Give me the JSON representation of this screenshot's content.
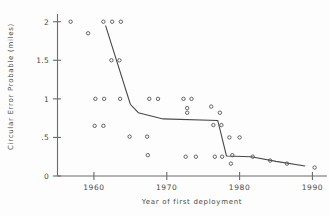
{
  "chart_data": {
    "type": "scatter",
    "title": "",
    "xlabel": "Year of first deployment",
    "ylabel": "Circular Error Probable (miles)",
    "xlim": [
      1955,
      1992
    ],
    "ylim": [
      0,
      2.1
    ],
    "xticks": [
      1960,
      1970,
      1980,
      1990
    ],
    "xtick_labels": [
      "1960",
      "1970",
      "1980",
      "1990"
    ],
    "yticks": [
      0,
      0.5,
      1,
      1.5,
      2
    ],
    "ytick_labels": [
      "0",
      ".5",
      "1",
      "1.5",
      "2"
    ],
    "grid": false,
    "legend": null,
    "series": [
      {
        "name": "Circular Error Probable observations",
        "marker": "open-circle",
        "points": [
          {
            "x": 1956.8,
            "y": 2.0
          },
          {
            "x": 1959.2,
            "y": 1.85
          },
          {
            "x": 1961.3,
            "y": 2.0
          },
          {
            "x": 1962.5,
            "y": 2.0
          },
          {
            "x": 1963.7,
            "y": 2.0
          },
          {
            "x": 1962.4,
            "y": 1.5
          },
          {
            "x": 1963.5,
            "y": 1.5
          },
          {
            "x": 1960.2,
            "y": 1.0
          },
          {
            "x": 1961.4,
            "y": 1.0
          },
          {
            "x": 1963.6,
            "y": 1.0
          },
          {
            "x": 1967.6,
            "y": 1.0
          },
          {
            "x": 1968.8,
            "y": 1.0
          },
          {
            "x": 1972.3,
            "y": 1.0
          },
          {
            "x": 1973.4,
            "y": 1.0
          },
          {
            "x": 1972.8,
            "y": 0.88
          },
          {
            "x": 1972.8,
            "y": 0.82
          },
          {
            "x": 1976.1,
            "y": 0.9
          },
          {
            "x": 1977.3,
            "y": 0.82
          },
          {
            "x": 1960.1,
            "y": 0.65
          },
          {
            "x": 1961.3,
            "y": 0.65
          },
          {
            "x": 1976.4,
            "y": 0.66
          },
          {
            "x": 1977.5,
            "y": 0.66
          },
          {
            "x": 1964.9,
            "y": 0.51
          },
          {
            "x": 1967.3,
            "y": 0.51
          },
          {
            "x": 1978.6,
            "y": 0.5
          },
          {
            "x": 1980.0,
            "y": 0.5
          },
          {
            "x": 1967.4,
            "y": 0.27
          },
          {
            "x": 1972.6,
            "y": 0.25
          },
          {
            "x": 1974.0,
            "y": 0.25
          },
          {
            "x": 1976.6,
            "y": 0.25
          },
          {
            "x": 1977.6,
            "y": 0.25
          },
          {
            "x": 1979.0,
            "y": 0.27
          },
          {
            "x": 1978.8,
            "y": 0.16
          },
          {
            "x": 1981.8,
            "y": 0.25
          },
          {
            "x": 1984.2,
            "y": 0.2
          },
          {
            "x": 1986.5,
            "y": 0.16
          },
          {
            "x": 1990.3,
            "y": 0.11
          }
        ]
      }
    ],
    "trend_line": {
      "name": "piecewise trend",
      "vertices": [
        {
          "x": 1961.6,
          "y": 1.95
        },
        {
          "x": 1965.0,
          "y": 0.93
        },
        {
          "x": 1966.1,
          "y": 0.82
        },
        {
          "x": 1969.5,
          "y": 0.74
        },
        {
          "x": 1977.0,
          "y": 0.72
        },
        {
          "x": 1978.2,
          "y": 0.26
        },
        {
          "x": 1981.6,
          "y": 0.25
        },
        {
          "x": 1985.0,
          "y": 0.19
        },
        {
          "x": 1989.0,
          "y": 0.13
        }
      ]
    }
  },
  "axes": {
    "y_title": "Circular Error Probable (miles)",
    "x_title": "Year of first deployment"
  }
}
